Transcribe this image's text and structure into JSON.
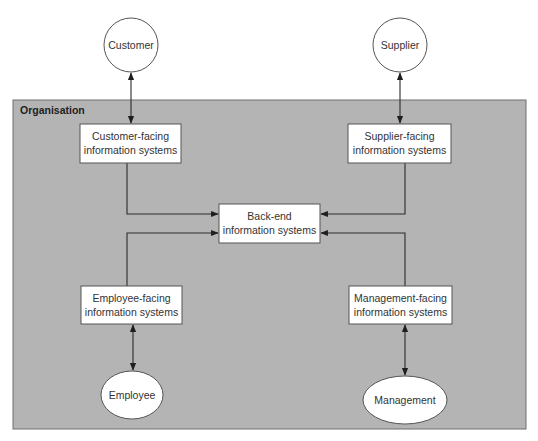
{
  "diagram": {
    "container": {
      "label": "Organisation",
      "fill": "#b4b4b4"
    },
    "external_entities": {
      "customer": {
        "label": "Customer",
        "shape": "circle"
      },
      "supplier": {
        "label": "Supplier",
        "shape": "circle"
      },
      "employee": {
        "label": "Employee",
        "shape": "ellipse"
      },
      "management": {
        "label": "Management",
        "shape": "ellipse"
      }
    },
    "systems": {
      "customer_facing": {
        "line1": "Customer-facing",
        "line2": "information systems"
      },
      "supplier_facing": {
        "line1": "Supplier-facing",
        "line2": "information systems"
      },
      "back_end": {
        "line1": "Back-end",
        "line2": "information systems"
      },
      "employee_facing": {
        "line1": "Employee-facing",
        "line2": "information systems"
      },
      "management_facing": {
        "line1": "Management-facing",
        "line2": "information systems"
      }
    },
    "connections": [
      {
        "from": "Customer",
        "to": "Customer-facing information systems",
        "type": "bidirectional"
      },
      {
        "from": "Supplier",
        "to": "Supplier-facing information systems",
        "type": "bidirectional"
      },
      {
        "from": "Employee",
        "to": "Employee-facing information systems",
        "type": "bidirectional"
      },
      {
        "from": "Management",
        "to": "Management-facing information systems",
        "type": "bidirectional"
      },
      {
        "from": "Customer-facing information systems",
        "to": "Back-end information systems",
        "type": "directed"
      },
      {
        "from": "Supplier-facing information systems",
        "to": "Back-end information systems",
        "type": "directed"
      },
      {
        "from": "Employee-facing information systems",
        "to": "Back-end information systems",
        "type": "directed"
      },
      {
        "from": "Management-facing information systems",
        "to": "Back-end information systems",
        "type": "directed"
      }
    ]
  }
}
